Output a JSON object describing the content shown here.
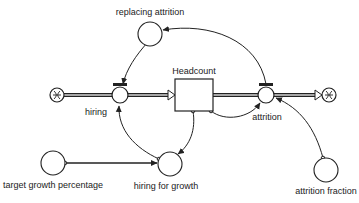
{
  "diagram": {
    "type": "stock-and-flow",
    "colors": {
      "stroke": "#222222",
      "background": "#ffffff"
    },
    "stock": {
      "id": "headcount",
      "label": "Headcount"
    },
    "flows": [
      {
        "id": "hiring",
        "label": "hiring",
        "from": "source-cloud",
        "to": "headcount"
      },
      {
        "id": "attrition",
        "label": "attrition",
        "from": "headcount",
        "to": "sink-cloud"
      }
    ],
    "auxiliaries": [
      {
        "id": "replacing-attrition",
        "label": "replacing attrition"
      },
      {
        "id": "hiring-for-growth",
        "label": "hiring for growth"
      },
      {
        "id": "target-growth-percentage",
        "label": "target growth percentage"
      },
      {
        "id": "attrition-fraction",
        "label": "attrition fraction"
      }
    ],
    "links": [
      {
        "from": "attrition",
        "to": "replacing-attrition"
      },
      {
        "from": "replacing-attrition",
        "to": "hiring"
      },
      {
        "from": "headcount",
        "to": "hiring-for-growth"
      },
      {
        "from": "target-growth-percentage",
        "to": "hiring-for-growth"
      },
      {
        "from": "hiring-for-growth",
        "to": "hiring"
      },
      {
        "from": "headcount",
        "to": "attrition"
      },
      {
        "from": "attrition-fraction",
        "to": "attrition"
      }
    ],
    "clouds": [
      {
        "id": "source-cloud",
        "icon": "cloud-icon"
      },
      {
        "id": "sink-cloud",
        "icon": "cloud-icon"
      }
    ]
  }
}
